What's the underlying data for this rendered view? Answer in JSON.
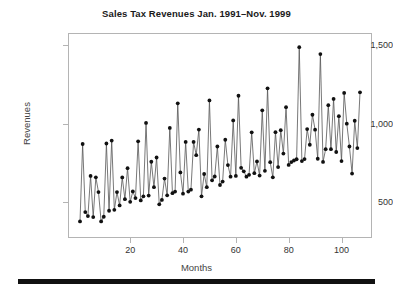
{
  "chart_data": {
    "type": "line",
    "title": "Sales Tax Revenues Jan. 1991–Nov. 1999",
    "xlabel": "Months",
    "ylabel": "Revenues",
    "xlim": [
      1,
      107
    ],
    "ylim": [
      330,
      1520
    ],
    "grid": false,
    "legend": null,
    "marker": "filled-circle",
    "xticks": [
      20,
      40,
      60,
      80,
      100
    ],
    "xtick_labels": [
      "20",
      "40",
      "60",
      "80",
      "100"
    ],
    "yticks": [
      500,
      1000,
      1500
    ],
    "ytick_labels": [
      "500",
      "1,000",
      "1,500"
    ],
    "series": [
      {
        "name": "Sales Tax Revenues",
        "color": "#111111",
        "x": [
          1,
          2,
          3,
          4,
          5,
          6,
          7,
          8,
          9,
          10,
          11,
          12,
          13,
          14,
          15,
          16,
          17,
          18,
          19,
          20,
          21,
          22,
          23,
          24,
          25,
          26,
          27,
          28,
          29,
          30,
          31,
          32,
          33,
          34,
          35,
          36,
          37,
          38,
          39,
          40,
          41,
          42,
          43,
          44,
          45,
          46,
          47,
          48,
          49,
          50,
          51,
          52,
          53,
          54,
          55,
          56,
          57,
          58,
          59,
          60,
          61,
          62,
          63,
          64,
          65,
          66,
          67,
          68,
          69,
          70,
          71,
          72,
          73,
          74,
          75,
          76,
          77,
          78,
          79,
          80,
          81,
          82,
          83,
          84,
          85,
          86,
          87,
          88,
          89,
          90,
          91,
          92,
          93,
          94,
          95,
          96,
          97,
          98,
          99,
          100,
          101,
          102,
          103,
          104,
          105,
          106,
          107
        ],
        "values": [
          378,
          871,
          438,
          412,
          668,
          406,
          659,
          565,
          378,
          408,
          874,
          446,
          893,
          452,
          565,
          480,
          658,
          520,
          717,
          503,
          569,
          527,
          888,
          512,
          538,
          1005,
          543,
          758,
          596,
          785,
          487,
          515,
          651,
          544,
          973,
          558,
          568,
          1130,
          690,
          555,
          884,
          568,
          580,
          884,
          800,
          963,
          538,
          680,
          596,
          1148,
          640,
          664,
          855,
          610,
          632,
          898,
          737,
          663,
          1021,
          668,
          1178,
          719,
          697,
          663,
          675,
          945,
          685,
          760,
          670,
          1085,
          700,
          1225,
          755,
          659,
          946,
          724,
          959,
          810,
          1105,
          738,
          756,
          766,
          774,
          1487,
          762,
          775,
          966,
          866,
          1057,
          962,
          777,
          1443,
          757,
          838,
          1118,
          838,
          1158,
          820,
          1048,
          762,
          1196,
          1000,
          855,
          683,
          1019,
          845,
          1200
        ]
      }
    ]
  },
  "axes": {
    "y_title": "Revenues",
    "x_title": "Months"
  },
  "bottom_bar": {
    "color": "#111111"
  }
}
